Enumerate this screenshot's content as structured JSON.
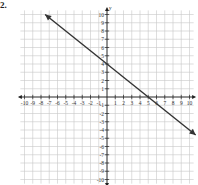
{
  "problem_number": "2.",
  "chart_data": {
    "type": "line",
    "title": "",
    "xlabel": "x",
    "ylabel": "y",
    "xlim": [
      -10,
      10
    ],
    "ylim": [
      -10,
      10
    ],
    "grid": true,
    "x_ticks": [
      -10,
      -9,
      -8,
      -7,
      -6,
      -5,
      -4,
      -3,
      -2,
      -1,
      1,
      2,
      3,
      4,
      5,
      6,
      7,
      8,
      9,
      10
    ],
    "y_ticks": [
      -10,
      -9,
      -8,
      -7,
      -6,
      -5,
      -4,
      -3,
      -2,
      -1,
      1,
      2,
      3,
      4,
      5,
      6,
      7,
      8,
      9,
      10
    ],
    "x_tick_labels": [
      "-10",
      "-9",
      "-8",
      "-7",
      "-6",
      "-5",
      "-4",
      "-3",
      "-2",
      "-1",
      "1",
      "2",
      "3",
      "4",
      "5",
      "6",
      "7",
      "8",
      "9",
      "10"
    ],
    "y_tick_labels": [
      "10",
      "9",
      "8",
      "7",
      "6",
      "5",
      "4",
      "3",
      "2",
      "1",
      "-1",
      "-2",
      "-3",
      "-4",
      "-5",
      "-6",
      "-7",
      "-8",
      "-9",
      "-10"
    ],
    "series": [
      {
        "name": "line",
        "slope": -0.8,
        "intercept": 4,
        "x": [
          -7.5,
          10.75
        ],
        "y": [
          10,
          -4.6
        ],
        "arrows": "both",
        "color": "#333333"
      }
    ],
    "key_points": [
      [
        0,
        4
      ],
      [
        5,
        0
      ]
    ]
  }
}
